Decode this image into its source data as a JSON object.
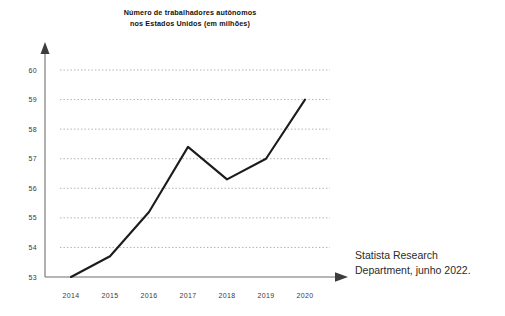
{
  "chart_data": {
    "type": "line",
    "title": "Número de trabalhadores autônomos\nnos Estados Unidos (em milhões)",
    "title_line1": "Número de trabalhadores autônomos",
    "title_line2": "nos Estados Unidos (em milhões)",
    "xlabel": "",
    "ylabel": "",
    "categories": [
      "2014",
      "2015",
      "2016",
      "2017",
      "2018",
      "2019",
      "2020"
    ],
    "x": [
      2014,
      2015,
      2016,
      2017,
      2018,
      2019,
      2020
    ],
    "values": [
      53.0,
      53.7,
      55.2,
      57.4,
      56.3,
      57.0,
      59.0
    ],
    "series": [
      {
        "name": "Trabalhadores autônomos (milhões)",
        "values": [
          53.0,
          53.7,
          55.2,
          57.4,
          56.3,
          57.0,
          59.0
        ]
      }
    ],
    "ylim": [
      53,
      60
    ],
    "xlim": [
      2014,
      2020
    ],
    "yticks": [
      53,
      54,
      55,
      56,
      57,
      58,
      59,
      60
    ],
    "ytick_labels": [
      "53",
      "54",
      "55",
      "56",
      "57",
      "58",
      "59",
      "60"
    ],
    "xtick_labels": [
      "2014",
      "2015",
      "2016",
      "2017",
      "2018",
      "2019",
      "2020"
    ],
    "grid": "horizontal-dotted",
    "legend": "none",
    "line_color": "#1c1c1c",
    "grid_color": "#9a9a9a",
    "axis_color": "#6f6f6f"
  },
  "source": {
    "text": "Statista Research\nDepartment, junho 2022.",
    "line1": "Statista Research",
    "line2": "Department, junho 2022."
  }
}
